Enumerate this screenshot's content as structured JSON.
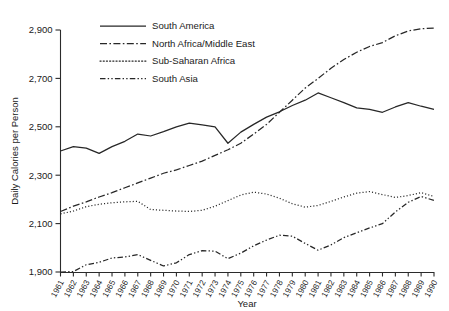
{
  "chart_data": {
    "type": "line",
    "title": "",
    "xlabel": "Year",
    "ylabel": "Daily Calories per Person",
    "ylim": [
      1900,
      2900
    ],
    "yticks": [
      "1,900",
      "2,100",
      "2,300",
      "2,500",
      "2,700",
      "2,900"
    ],
    "ytick_values": [
      1900,
      2100,
      2300,
      2500,
      2700,
      2900
    ],
    "grid": false,
    "legend_position": "top-center",
    "x": [
      1961,
      1962,
      1963,
      1964,
      1965,
      1966,
      1967,
      1968,
      1969,
      1970,
      1971,
      1972,
      1973,
      1974,
      1975,
      1976,
      1977,
      1978,
      1979,
      1980,
      1981,
      1982,
      1983,
      1984,
      1985,
      1986,
      1987,
      1988,
      1989,
      1990
    ],
    "xtick_labels": [
      "1961",
      "1962",
      "1963",
      "1964",
      "1965",
      "1966",
      "1967",
      "1968",
      "1969",
      "1970",
      "1971",
      "1972",
      "1973",
      "1974",
      "1975",
      "1976",
      "1977",
      "1978",
      "1979",
      "1980",
      "1981",
      "1982",
      "1983",
      "1984",
      "1985",
      "1986",
      "1987",
      "1988",
      "1989",
      "1990"
    ],
    "series": [
      {
        "name": "South America",
        "style": "solid",
        "values": [
          2400,
          2418,
          2412,
          2390,
          2418,
          2440,
          2470,
          2462,
          2480,
          2500,
          2515,
          2508,
          2500,
          2432,
          2478,
          2510,
          2540,
          2562,
          2588,
          2610,
          2640,
          2620,
          2600,
          2578,
          2572,
          2560,
          2582,
          2600,
          2585,
          2572
        ]
      },
      {
        "name": "North Africa/Middle East",
        "style": "dash-dot",
        "values": [
          2150,
          2172,
          2190,
          2210,
          2228,
          2248,
          2268,
          2288,
          2308,
          2322,
          2340,
          2358,
          2382,
          2405,
          2432,
          2470,
          2510,
          2560,
          2610,
          2660,
          2700,
          2742,
          2778,
          2808,
          2832,
          2848,
          2876,
          2896,
          2905,
          2908
        ]
      },
      {
        "name": "Sub-Saharan Africa",
        "style": "dotted",
        "values": [
          2140,
          2152,
          2170,
          2180,
          2186,
          2190,
          2192,
          2158,
          2155,
          2152,
          2150,
          2155,
          2172,
          2195,
          2218,
          2230,
          2222,
          2205,
          2182,
          2168,
          2175,
          2192,
          2210,
          2226,
          2232,
          2220,
          2208,
          2216,
          2228,
          2212
        ]
      },
      {
        "name": "South Asia",
        "style": "dash-dot-dot",
        "values": [
          1900,
          1902,
          1930,
          1940,
          1958,
          1962,
          1972,
          1948,
          1925,
          1938,
          1972,
          1988,
          1986,
          1955,
          1978,
          2008,
          2032,
          2052,
          2048,
          2018,
          1990,
          2012,
          2042,
          2062,
          2082,
          2100,
          2148,
          2188,
          2212,
          2196
        ]
      }
    ]
  },
  "legend": {
    "items": [
      {
        "label": "South America",
        "style": "solid"
      },
      {
        "label": "North Africa/Middle East",
        "style": "dash-dot"
      },
      {
        "label": "Sub-Saharan Africa",
        "style": "dotted"
      },
      {
        "label": "South Asia",
        "style": "dash-dot-dot"
      }
    ]
  }
}
